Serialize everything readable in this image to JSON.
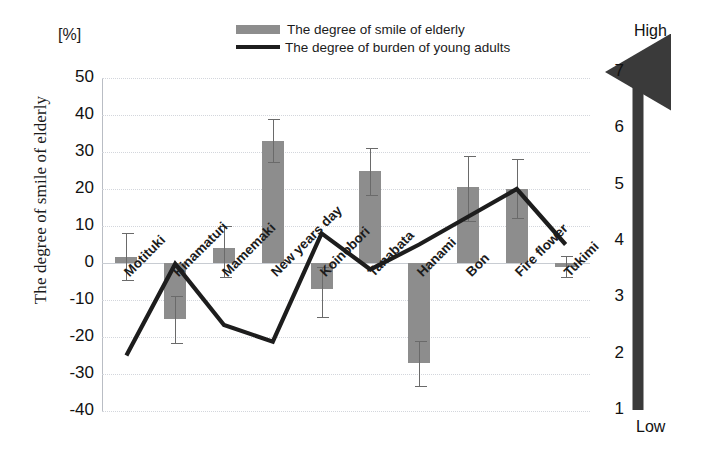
{
  "chart_data": {
    "type": "bar",
    "title": "",
    "categories": [
      "Motituki",
      "Hinamaturi",
      "Mamemaki",
      "New years day",
      "Koinobori",
      "Tanabata",
      "Hanami",
      "Bon",
      "Fire flower",
      "Tukimi"
    ],
    "series": [
      {
        "name": "The degree of smile of elderly",
        "type": "bar",
        "axis": "left",
        "unit": "%",
        "values": [
          1.5,
          -15.0,
          4.0,
          33.0,
          -7.0,
          25.0,
          -27.0,
          20.5,
          20.0,
          -1.0
        ],
        "error_low": [
          -5.0,
          -22.0,
          -4.0,
          27.0,
          -15.0,
          18.0,
          -33.5,
          11.0,
          12.0,
          -4.0
        ],
        "error_high": [
          8.0,
          -9.0,
          10.0,
          39.0,
          -1.0,
          31.0,
          -21.0,
          29.0,
          28.0,
          2.0
        ],
        "color": "#8d8d8d"
      },
      {
        "name": "The degree of burden of young adults",
        "type": "line",
        "axis": "right",
        "values": [
          2.0,
          3.65,
          2.55,
          2.25,
          4.2,
          3.55,
          4.0,
          4.5,
          5.0,
          4.0
        ],
        "color": "#1d1d1d"
      }
    ],
    "xlabel": "",
    "ylabel": "The degree of smile of elderly",
    "y_unit_label": "[%]",
    "ylim": [
      -40,
      50
    ],
    "yticks": [
      50,
      40,
      30,
      20,
      10,
      0,
      -10,
      -20,
      -30,
      -40
    ],
    "y2label": "The degree of burden",
    "y2lim": [
      1,
      7
    ],
    "y2ticks": [
      7,
      6,
      5,
      4,
      3,
      2,
      1
    ],
    "y2_high_label": "High",
    "y2_low_label": "Low",
    "grid": true,
    "legend_position": "top-center"
  },
  "legend": {
    "bar_label": "The degree of smile of elderly",
    "line_label": "The degree of burden of young adults"
  },
  "left_axis": {
    "unit": "[%]",
    "title": "The degree of smile of elderly",
    "ticks": [
      "50",
      "40",
      "30",
      "20",
      "10",
      "0",
      "-10",
      "-20",
      "-30",
      "-40"
    ]
  },
  "right_axis": {
    "title": "The degree of burden",
    "high": "High",
    "low": "Low",
    "ticks": [
      "7",
      "6",
      "5",
      "4",
      "3",
      "2",
      "1"
    ]
  },
  "x_labels": [
    "Motituki",
    "Hinamaturi",
    "Mamemaki",
    "New years day",
    "Koinobori",
    "Tanabata",
    "Hanami",
    "Bon",
    "Fire flower",
    "Tukimi"
  ]
}
